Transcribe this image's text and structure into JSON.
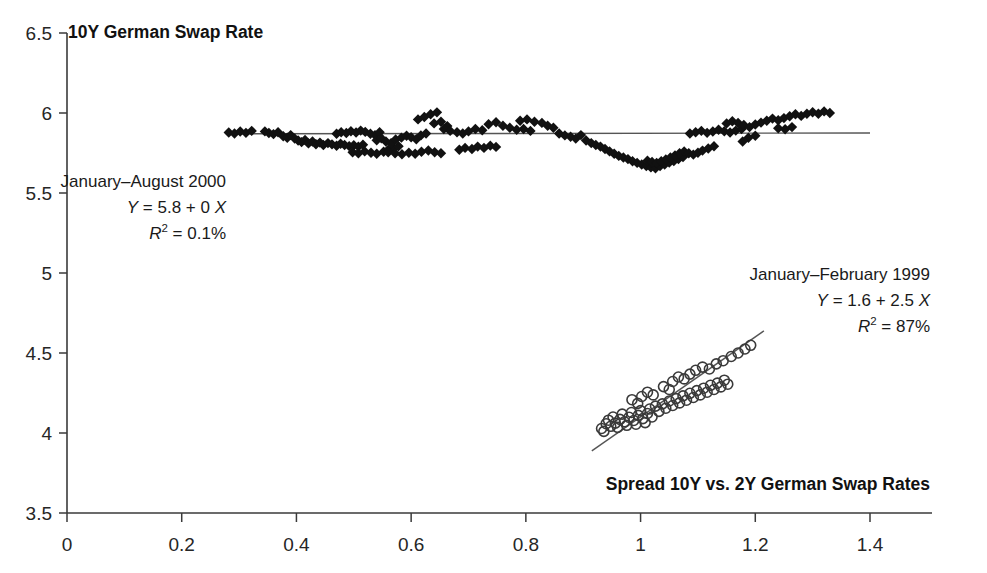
{
  "chart_data": {
    "type": "scatter",
    "title": "",
    "ylabel": "10Y German Swap Rate",
    "xlabel": "Spread 10Y vs. 2Y German Swap Rates",
    "xlim": [
      0,
      1.5
    ],
    "ylim": [
      3.5,
      6.5
    ],
    "grid": false,
    "legend": "none",
    "xticks": [
      0,
      0.2,
      0.4,
      0.6,
      0.8,
      1,
      1.2,
      1.4
    ],
    "xtick_labels": [
      "0",
      "0.2",
      "0.4",
      "0.6",
      "0.8",
      "1",
      "1.2",
      "1.4"
    ],
    "yticks": [
      3.5,
      4,
      4.5,
      5,
      5.5,
      6,
      6.5
    ],
    "ytick_labels": [
      "3.5",
      "4",
      "4.5",
      "5",
      "5.5",
      "6",
      "6.5"
    ],
    "series": [
      {
        "name": "January–August 2000",
        "marker": "diamond",
        "color": "#111111",
        "fit": {
          "equation": "Y = 5.8 + 0 X",
          "intercept": 5.8,
          "slope": 0.0,
          "r2_label": "0.1%",
          "r2": 0.001,
          "x_start": 0.28,
          "x_end": 1.4,
          "y_start": 5.87,
          "y_end": 5.875
        },
        "points": [
          [
            0.345,
            5.885
          ],
          [
            0.352,
            5.875
          ],
          [
            0.36,
            5.868
          ],
          [
            0.368,
            5.88
          ],
          [
            0.377,
            5.855
          ],
          [
            0.384,
            5.845
          ],
          [
            0.39,
            5.862
          ],
          [
            0.397,
            5.84
          ],
          [
            0.403,
            5.828
          ],
          [
            0.409,
            5.818
          ],
          [
            0.415,
            5.832
          ],
          [
            0.421,
            5.81
          ],
          [
            0.428,
            5.822
          ],
          [
            0.434,
            5.805
          ],
          [
            0.441,
            5.815
          ],
          [
            0.447,
            5.8
          ],
          [
            0.455,
            5.812
          ],
          [
            0.462,
            5.804
          ],
          [
            0.47,
            5.795
          ],
          [
            0.477,
            5.808
          ],
          [
            0.484,
            5.8
          ],
          [
            0.492,
            5.793
          ],
          [
            0.5,
            5.798
          ],
          [
            0.508,
            5.79
          ],
          [
            0.516,
            5.802
          ],
          [
            0.47,
            5.87
          ],
          [
            0.478,
            5.88
          ],
          [
            0.487,
            5.875
          ],
          [
            0.495,
            5.886
          ],
          [
            0.504,
            5.878
          ],
          [
            0.512,
            5.89
          ],
          [
            0.52,
            5.882
          ],
          [
            0.529,
            5.87
          ],
          [
            0.537,
            5.862
          ],
          [
            0.545,
            5.88
          ],
          [
            0.498,
            5.755
          ],
          [
            0.508,
            5.748
          ],
          [
            0.519,
            5.76
          ],
          [
            0.53,
            5.752
          ],
          [
            0.54,
            5.745
          ],
          [
            0.552,
            5.758
          ],
          [
            0.56,
            5.77
          ],
          [
            0.57,
            5.78
          ],
          [
            0.578,
            5.792
          ],
          [
            0.54,
            5.83
          ],
          [
            0.548,
            5.842
          ],
          [
            0.556,
            5.822
          ],
          [
            0.565,
            5.812
          ],
          [
            0.573,
            5.834
          ],
          [
            0.583,
            5.846
          ],
          [
            0.592,
            5.858
          ],
          [
            0.6,
            5.848
          ],
          [
            0.609,
            5.836
          ],
          [
            0.617,
            5.86
          ],
          [
            0.626,
            5.872
          ],
          [
            0.56,
            5.755
          ],
          [
            0.572,
            5.748
          ],
          [
            0.584,
            5.742
          ],
          [
            0.596,
            5.752
          ],
          [
            0.607,
            5.745
          ],
          [
            0.618,
            5.758
          ],
          [
            0.63,
            5.766
          ],
          [
            0.641,
            5.755
          ],
          [
            0.652,
            5.748
          ],
          [
            0.612,
            5.96
          ],
          [
            0.623,
            5.975
          ],
          [
            0.634,
            5.992
          ],
          [
            0.645,
            6.004
          ],
          [
            0.64,
            5.935
          ],
          [
            0.652,
            5.945
          ],
          [
            0.663,
            5.918
          ],
          [
            0.657,
            5.9
          ],
          [
            0.668,
            5.888
          ],
          [
            0.68,
            5.88
          ],
          [
            0.69,
            5.872
          ],
          [
            0.7,
            5.885
          ],
          [
            0.712,
            5.9
          ],
          [
            0.724,
            5.892
          ],
          [
            0.684,
            5.77
          ],
          [
            0.694,
            5.782
          ],
          [
            0.706,
            5.775
          ],
          [
            0.716,
            5.79
          ],
          [
            0.727,
            5.782
          ],
          [
            0.738,
            5.796
          ],
          [
            0.748,
            5.788
          ],
          [
            0.735,
            5.93
          ],
          [
            0.748,
            5.942
          ],
          [
            0.76,
            5.92
          ],
          [
            0.772,
            5.908
          ],
          [
            0.784,
            5.895
          ],
          [
            0.796,
            5.9
          ],
          [
            0.808,
            5.888
          ],
          [
            0.79,
            5.952
          ],
          [
            0.802,
            5.96
          ],
          [
            0.815,
            5.945
          ],
          [
            0.828,
            5.938
          ],
          [
            0.838,
            5.92
          ],
          [
            0.848,
            5.908
          ],
          [
            0.858,
            5.872
          ],
          [
            0.868,
            5.86
          ],
          [
            0.878,
            5.852
          ],
          [
            0.887,
            5.84
          ],
          [
            0.896,
            5.862
          ],
          [
            0.905,
            5.828
          ],
          [
            0.914,
            5.812
          ],
          [
            0.922,
            5.8
          ],
          [
            0.93,
            5.79
          ],
          [
            0.938,
            5.775
          ],
          [
            0.946,
            5.76
          ],
          [
            0.954,
            5.745
          ],
          [
            0.962,
            5.732
          ],
          [
            0.97,
            5.722
          ],
          [
            0.978,
            5.712
          ],
          [
            0.986,
            5.698
          ],
          [
            0.994,
            5.688
          ],
          [
            1.002,
            5.678
          ],
          [
            1.01,
            5.668
          ],
          [
            1.018,
            5.66
          ],
          [
            1.026,
            5.655
          ],
          [
            1.034,
            5.668
          ],
          [
            1.042,
            5.678
          ],
          [
            1.05,
            5.69
          ],
          [
            1.058,
            5.7
          ],
          [
            1.066,
            5.712
          ],
          [
            1.074,
            5.725
          ],
          [
            1.012,
            5.702
          ],
          [
            1.02,
            5.694
          ],
          [
            1.028,
            5.688
          ],
          [
            1.036,
            5.698
          ],
          [
            1.044,
            5.71
          ],
          [
            1.052,
            5.722
          ],
          [
            1.06,
            5.735
          ],
          [
            1.068,
            5.748
          ],
          [
            1.076,
            5.76
          ],
          [
            1.084,
            5.748
          ],
          [
            1.092,
            5.74
          ],
          [
            1.1,
            5.752
          ],
          [
            1.108,
            5.765
          ],
          [
            1.118,
            5.778
          ],
          [
            1.128,
            5.792
          ],
          [
            1.086,
            5.872
          ],
          [
            1.096,
            5.88
          ],
          [
            1.106,
            5.888
          ],
          [
            1.116,
            5.876
          ],
          [
            1.126,
            5.884
          ],
          [
            1.136,
            5.895
          ],
          [
            1.146,
            5.886
          ],
          [
            1.156,
            5.878
          ],
          [
            1.166,
            5.89
          ],
          [
            1.176,
            5.9
          ],
          [
            1.15,
            5.935
          ],
          [
            1.16,
            5.948
          ],
          [
            1.17,
            5.938
          ],
          [
            1.18,
            5.925
          ],
          [
            1.19,
            5.912
          ],
          [
            1.2,
            5.928
          ],
          [
            1.21,
            5.94
          ],
          [
            1.22,
            5.952
          ],
          [
            1.23,
            5.965
          ],
          [
            1.24,
            5.955
          ],
          [
            1.25,
            5.968
          ],
          [
            1.26,
            5.98
          ],
          [
            1.27,
            5.992
          ],
          [
            1.28,
            5.982
          ],
          [
            1.29,
            5.995
          ],
          [
            1.3,
            6.005
          ],
          [
            1.31,
            5.995
          ],
          [
            1.32,
            6.01
          ],
          [
            1.33,
            6.0
          ],
          [
            1.24,
            5.905
          ],
          [
            1.252,
            5.898
          ],
          [
            1.264,
            5.912
          ],
          [
            1.188,
            5.845
          ],
          [
            1.2,
            5.858
          ],
          [
            1.178,
            5.822
          ],
          [
            0.282,
            5.878
          ],
          [
            0.292,
            5.872
          ],
          [
            0.302,
            5.884
          ],
          [
            0.312,
            5.876
          ],
          [
            0.322,
            5.888
          ]
        ]
      },
      {
        "name": "January–February 1999",
        "marker": "circle",
        "color": "#3a3a3a",
        "fit": {
          "equation": "Y = 1.6 + 2.5 X",
          "intercept": 1.6,
          "slope": 2.5,
          "r2_label": "87%",
          "r2": 0.87,
          "x_start": 0.915,
          "x_end": 1.215,
          "y_start": 3.888,
          "y_end": 4.638
        },
        "points": [
          [
            0.932,
            4.028
          ],
          [
            0.936,
            4.01
          ],
          [
            0.94,
            4.058
          ],
          [
            0.944,
            4.08
          ],
          [
            0.948,
            4.042
          ],
          [
            0.952,
            4.1
          ],
          [
            0.956,
            4.062
          ],
          [
            0.96,
            4.035
          ],
          [
            0.964,
            4.085
          ],
          [
            0.968,
            4.118
          ],
          [
            0.972,
            4.07
          ],
          [
            0.976,
            4.048
          ],
          [
            0.98,
            4.098
          ],
          [
            0.984,
            4.128
          ],
          [
            0.988,
            4.078
          ],
          [
            0.992,
            4.055
          ],
          [
            0.996,
            4.11
          ],
          [
            1.0,
            4.14
          ],
          [
            1.004,
            4.09
          ],
          [
            1.008,
            4.065
          ],
          [
            1.012,
            4.122
          ],
          [
            1.016,
            4.15
          ],
          [
            1.02,
            4.1
          ],
          [
            1.026,
            4.168
          ],
          [
            1.032,
            4.135
          ],
          [
            1.038,
            4.182
          ],
          [
            1.044,
            4.155
          ],
          [
            1.05,
            4.2
          ],
          [
            1.056,
            4.172
          ],
          [
            1.062,
            4.215
          ],
          [
            1.068,
            4.188
          ],
          [
            1.074,
            4.232
          ],
          [
            1.08,
            4.205
          ],
          [
            1.086,
            4.248
          ],
          [
            1.092,
            4.222
          ],
          [
            1.098,
            4.265
          ],
          [
            1.104,
            4.238
          ],
          [
            1.11,
            4.28
          ],
          [
            1.116,
            4.255
          ],
          [
            1.122,
            4.298
          ],
          [
            1.128,
            4.272
          ],
          [
            1.134,
            4.312
          ],
          [
            1.14,
            4.288
          ],
          [
            1.146,
            4.33
          ],
          [
            1.152,
            4.305
          ],
          [
            1.056,
            4.322
          ],
          [
            1.066,
            4.35
          ],
          [
            1.076,
            4.338
          ],
          [
            1.086,
            4.368
          ],
          [
            1.096,
            4.392
          ],
          [
            1.108,
            4.412
          ],
          [
            1.12,
            4.4
          ],
          [
            1.132,
            4.432
          ],
          [
            1.144,
            4.452
          ],
          [
            1.158,
            4.478
          ],
          [
            1.17,
            4.5
          ],
          [
            1.182,
            4.525
          ],
          [
            1.192,
            4.548
          ],
          [
            1.04,
            4.29
          ],
          [
            1.05,
            4.272
          ],
          [
            0.985,
            4.208
          ],
          [
            0.995,
            4.185
          ],
          [
            1.002,
            4.228
          ],
          [
            1.012,
            4.255
          ],
          [
            1.022,
            4.238
          ]
        ]
      }
    ],
    "annotations": [
      {
        "id": "annot-2000",
        "lines": [
          {
            "text": "January–August 2000",
            "style": "normal"
          },
          {
            "text": "Y = 5.8 + 0 X",
            "style": "italic-eq"
          },
          {
            "text": "R² = 0.1%",
            "style": "italic-eq"
          }
        ]
      },
      {
        "id": "annot-1999",
        "lines": [
          {
            "text": "January–February 1999",
            "style": "normal"
          },
          {
            "text": "Y = 1.6 + 2.5 X",
            "style": "italic-eq"
          },
          {
            "text": "R² = 87%",
            "style": "italic-eq"
          }
        ]
      }
    ]
  },
  "labels": {
    "y_axis_title": "10Y German Swap Rate",
    "x_axis_title": "Spread 10Y vs. 2Y German Swap Rates",
    "annot_2000_l1": "January–August 2000",
    "annot_2000_l2_y": "Y",
    "annot_2000_l2_rest": " = 5.8 + 0 ",
    "annot_2000_l2_x": "X",
    "annot_2000_l3_r": "R",
    "annot_2000_l3_sup": "2",
    "annot_2000_l3_rest": " = 0.1%",
    "annot_1999_l1": "January–February 1999",
    "annot_1999_l2_y": "Y",
    "annot_1999_l2_rest": " = 1.6 + 2.5 ",
    "annot_1999_l2_x": "X",
    "annot_1999_l3_r": "R",
    "annot_1999_l3_sup": "2",
    "annot_1999_l3_rest": " = 87%"
  }
}
